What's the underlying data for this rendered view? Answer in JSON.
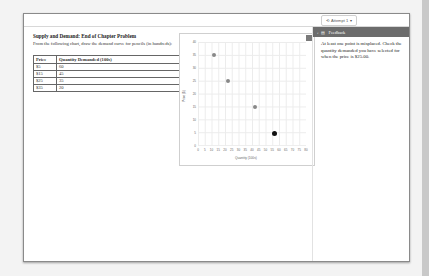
{
  "attempt": {
    "label": "Attempt 1",
    "icon": "history-icon"
  },
  "problem": {
    "title": "Supply and Demand: End of Chapter Problem",
    "description": "From the following chart, draw the demand curve for pencils (in hundreds):",
    "table": {
      "headers": [
        "Price",
        "Quantity Demanded (100s)"
      ],
      "rows": [
        [
          "$5",
          "60"
        ],
        [
          "$15",
          "45"
        ],
        [
          "$25",
          "35"
        ],
        [
          "$35",
          "20"
        ]
      ]
    }
  },
  "chart_data": {
    "type": "scatter",
    "title": "",
    "xlabel": "Quantity (100s)",
    "ylabel": "Price ($)",
    "xlim": [
      0,
      80
    ],
    "ylim": [
      0,
      40
    ],
    "x_ticks": [
      0,
      5,
      10,
      15,
      20,
      25,
      30,
      35,
      40,
      45,
      50,
      55,
      60,
      65,
      70,
      75,
      80
    ],
    "y_ticks": [
      0,
      5,
      10,
      15,
      20,
      25,
      30,
      35,
      40
    ],
    "grid": true,
    "points": [
      {
        "x": 12,
        "y": 35,
        "selected": false
      },
      {
        "x": 22,
        "y": 25,
        "selected": false
      },
      {
        "x": 42,
        "y": 15,
        "selected": false
      },
      {
        "x": 57,
        "y": 5,
        "selected": true
      }
    ]
  },
  "feedback": {
    "title": "Feedback",
    "message": "At least one point is misplaced. Check the quantity demanded you have selected for when the price is $25.00."
  }
}
